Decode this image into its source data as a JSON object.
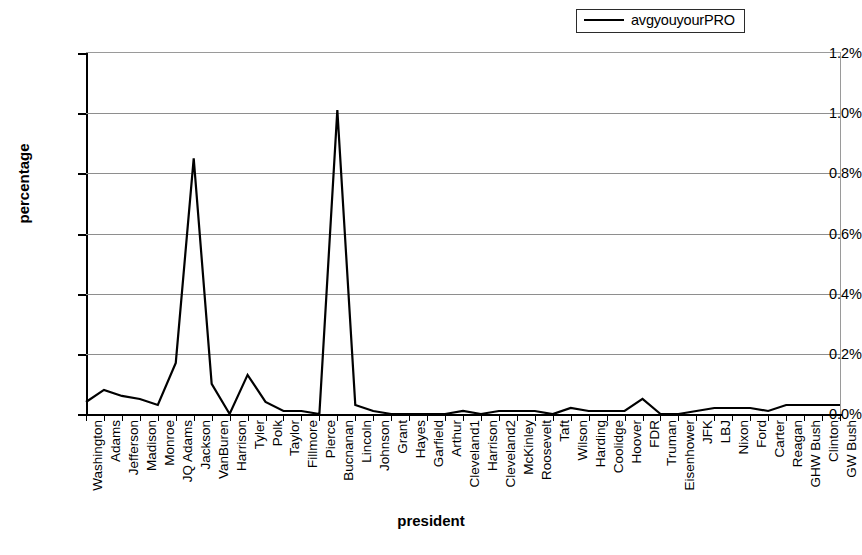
{
  "chart_data": {
    "type": "line",
    "title": "",
    "xlabel": "president",
    "ylabel": "percentage",
    "ylim": [
      0,
      1.2
    ],
    "ytick_labels": [
      "0.0%",
      "0.2%",
      "0.4%",
      "0.6%",
      "0.8%",
      "1.0%",
      "1.2%"
    ],
    "ytick_values": [
      0.0,
      0.2,
      0.4,
      0.6,
      0.8,
      1.0,
      1.2
    ],
    "grid": true,
    "legend_position": "top-right",
    "legend": [
      "avgyouyourPRO"
    ],
    "series_color": "#000000",
    "categories": [
      "Washington",
      "Adams",
      "Jefferson",
      "Madison",
      "Monroe",
      "JQ Adams",
      "Jackson",
      "VanBuren",
      "Harrison",
      "Tyler",
      "Polk",
      "Taylor",
      "Fillmore",
      "Pierce",
      "Bucnanan",
      "Lincoln",
      "Johnson",
      "Grant",
      "Hayes",
      "Garfield",
      "Arthur",
      "Cleveland1",
      "Harrison",
      "Cleveland2",
      "McKinley",
      "Roosevelt",
      "Taft",
      "Wilson",
      "Harding",
      "Coolidge",
      "Hoover",
      "FDR",
      "Truman",
      "Eisenhower",
      "JFK",
      "LBJ",
      "Nixon",
      "Ford",
      "Carter",
      "Reagan",
      "GHW Bush",
      "Clinton",
      "GW Bush"
    ],
    "series": [
      {
        "name": "avgyouyourPRO",
        "values": [
          0.04,
          0.08,
          0.06,
          0.05,
          0.03,
          0.17,
          0.85,
          0.1,
          0.0,
          0.13,
          0.04,
          0.01,
          0.01,
          0.0,
          1.01,
          0.03,
          0.01,
          0.0,
          0.0,
          0.0,
          0.0,
          0.01,
          0.0,
          0.01,
          0.01,
          0.01,
          0.0,
          0.02,
          0.01,
          0.01,
          0.01,
          0.05,
          0.0,
          0.0,
          0.01,
          0.02,
          0.02,
          0.02,
          0.01,
          0.03,
          0.03,
          0.03,
          0.03
        ]
      }
    ]
  }
}
